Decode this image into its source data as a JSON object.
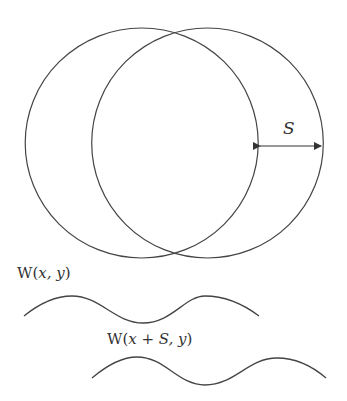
{
  "diagram": {
    "colors": {
      "stroke": "#444444",
      "background": "#ffffff"
    },
    "circles": [
      {
        "name": "original-circle",
        "cx": 141.7,
        "cy": 143,
        "rx": 116.5,
        "ry": 115
      },
      {
        "name": "shifted-circle",
        "cx": 207.5,
        "cy": 143,
        "rx": 115.8,
        "ry": 115
      }
    ],
    "shift_arrow": {
      "label": "S",
      "x1": 258,
      "x2": 323,
      "y": 146
    },
    "waves": [
      {
        "label_prefix": "W(",
        "label_args": "x, y",
        "label_suffix": ")"
      },
      {
        "label_prefix": "W(",
        "label_args": "x + S, y",
        "label_suffix": ")"
      }
    ]
  }
}
